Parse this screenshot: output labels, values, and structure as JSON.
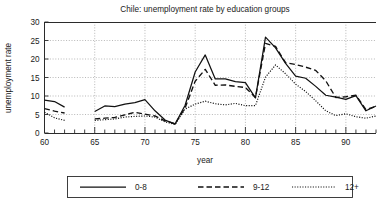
{
  "chart_data": {
    "type": "line",
    "title": "Chile: unemployment rate by education groups",
    "xlabel": "year",
    "ylabel": "unemployment rate",
    "xlim": [
      60,
      93
    ],
    "ylim": [
      0,
      30
    ],
    "xticks": [
      60,
      65,
      70,
      75,
      80,
      85,
      90
    ],
    "xtick_labels": [
      "60",
      "65",
      "70",
      "75",
      "80",
      "85",
      "90"
    ],
    "yticks": [
      0,
      5,
      10,
      15,
      20,
      25,
      30
    ],
    "ytick_labels": [
      "0",
      "5",
      "10",
      "15",
      "20",
      "25",
      "30"
    ],
    "xminor_step": 1,
    "grid": true,
    "grid_style": "dotted",
    "legend_position": "below",
    "series": [
      {
        "name": "0-8",
        "style": "solid",
        "segments": [
          {
            "x": [
              60,
              61,
              62
            ],
            "values": [
              8.9,
              8.5,
              7.0
            ]
          },
          {
            "x": [
              65,
              66,
              67,
              68,
              69,
              70,
              71,
              72,
              73,
              74,
              75,
              76,
              77,
              78,
              79,
              80,
              81,
              82,
              83,
              84,
              85,
              86,
              87,
              88,
              89,
              90,
              91,
              92,
              93
            ],
            "values": [
              5.8,
              7.3,
              7.1,
              7.8,
              8.2,
              9.0,
              6.0,
              3.5,
              2.4,
              7.5,
              16.5,
              21.1,
              14.6,
              14.6,
              13.9,
              13.6,
              9.5,
              25.9,
              23.0,
              18.8,
              15.4,
              14.8,
              12.6,
              10.2,
              9.7,
              9.1,
              10.1,
              6.0,
              7.3
            ]
          }
        ]
      },
      {
        "name": "9-12",
        "style": "dashed",
        "segments": [
          {
            "x": [
              60,
              61,
              62
            ],
            "values": [
              6.6,
              5.9,
              5.4
            ]
          },
          {
            "x": [
              65,
              66,
              67,
              68,
              69,
              70,
              71,
              72,
              73,
              74,
              75,
              76,
              77,
              78,
              79,
              80,
              81,
              82,
              83,
              84,
              85,
              86,
              87,
              88,
              89,
              90,
              91,
              92,
              93
            ],
            "values": [
              3.8,
              4.0,
              4.2,
              4.9,
              5.6,
              5.1,
              4.6,
              3.3,
              2.5,
              6.8,
              14.0,
              17.2,
              12.9,
              13.0,
              12.6,
              12.3,
              9.6,
              24.2,
              23.4,
              19.0,
              18.5,
              17.8,
              16.9,
              14.1,
              9.6,
              9.8,
              10.2,
              6.3,
              7.2
            ]
          }
        ]
      },
      {
        "name": "12+",
        "style": "dotted",
        "segments": [
          {
            "x": [
              60,
              61,
              62
            ],
            "values": [
              5.6,
              4.1,
              3.4
            ]
          },
          {
            "x": [
              65,
              66,
              67,
              68,
              69,
              70,
              71,
              72,
              73,
              74,
              75,
              76,
              77,
              78,
              79,
              80,
              81,
              82,
              83,
              84,
              85,
              86,
              87,
              88,
              89,
              90,
              91,
              92,
              93
            ],
            "values": [
              3.4,
              3.6,
              3.8,
              4.3,
              4.5,
              4.6,
              4.3,
              3.0,
              2.3,
              6.5,
              7.8,
              8.6,
              7.9,
              7.6,
              8.0,
              7.4,
              7.4,
              15.1,
              18.4,
              16.0,
              13.2,
              11.2,
              8.7,
              6.0,
              4.7,
              5.2,
              4.4,
              4.0,
              4.6
            ]
          }
        ]
      }
    ],
    "legend_entries": [
      {
        "label": "0-8",
        "style": "solid"
      },
      {
        "label": "9-12",
        "style": "dashed"
      },
      {
        "label": "12+",
        "style": "dotted"
      }
    ]
  }
}
